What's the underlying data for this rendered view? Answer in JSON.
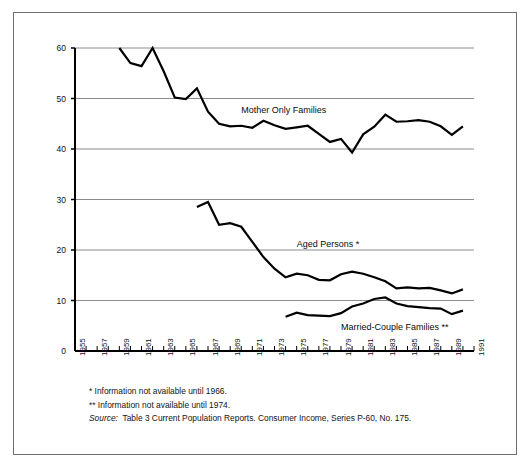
{
  "chart_data": {
    "type": "line",
    "title": "",
    "subtitle": "",
    "xlabel": "",
    "ylabel": "",
    "xlim": [
      1955,
      1991
    ],
    "ylim": [
      0,
      60
    ],
    "grid": "horizontal",
    "legend_position": "inline-annotations",
    "y_ticks": [
      0,
      10,
      20,
      30,
      40,
      50,
      60
    ],
    "y_tick_labels": [
      "0",
      "10",
      "20",
      "30",
      "40",
      "50",
      "60"
    ],
    "x_ticks": [
      1955,
      1956,
      1957,
      1958,
      1959,
      1960,
      1961,
      1962,
      1963,
      1964,
      1965,
      1966,
      1967,
      1968,
      1969,
      1970,
      1971,
      1972,
      1973,
      1974,
      1975,
      1976,
      1977,
      1978,
      1979,
      1980,
      1981,
      1982,
      1983,
      1984,
      1985,
      1986,
      1987,
      1988,
      1989,
      1990,
      1991
    ],
    "x_tick_labels": [
      "1955",
      "1957",
      "1959",
      "1961",
      "1963",
      "1965",
      "1967",
      "1969",
      "1971",
      "1973",
      "1975",
      "1977",
      "1979",
      "1981",
      "1983",
      "1985",
      "1987",
      "1989",
      "1991"
    ],
    "x_tick_labeled_years": [
      1955,
      1957,
      1959,
      1961,
      1963,
      1965,
      1967,
      1969,
      1971,
      1973,
      1975,
      1977,
      1979,
      1981,
      1983,
      1985,
      1987,
      1989,
      1991
    ],
    "series": [
      {
        "name": "Mother Only Families",
        "annotation": "Mother Only Families",
        "color": "#000000",
        "x": [
          1959,
          1960,
          1961,
          1962,
          1963,
          1964,
          1965,
          1966,
          1967,
          1968,
          1969,
          1970,
          1971,
          1972,
          1973,
          1974,
          1975,
          1976,
          1977,
          1978,
          1979,
          1980,
          1981,
          1982,
          1983,
          1984,
          1985,
          1986,
          1987,
          1988,
          1989,
          1990
        ],
        "values": [
          60.0,
          57.0,
          56.4,
          60.0,
          55.4,
          50.2,
          49.9,
          52.0,
          47.4,
          45.0,
          44.5,
          44.6,
          44.2,
          45.6,
          44.7,
          44.0,
          44.3,
          44.6,
          43.0,
          41.4,
          42.0,
          39.3,
          42.9,
          44.4,
          46.8,
          45.4,
          45.5,
          45.7,
          45.4,
          44.5,
          42.8,
          44.5
        ],
        "note": "Percent below poverty level, female householder, no husband present"
      },
      {
        "name": "Aged Persons *",
        "annotation": "Aged Persons *",
        "color": "#000000",
        "x": [
          1966,
          1967,
          1968,
          1969,
          1970,
          1971,
          1972,
          1973,
          1974,
          1975,
          1976,
          1977,
          1978,
          1979,
          1980,
          1981,
          1982,
          1983,
          1984,
          1985,
          1986,
          1987,
          1988,
          1989,
          1990
        ],
        "values": [
          28.5,
          29.5,
          25.0,
          25.3,
          24.6,
          21.6,
          18.6,
          16.3,
          14.6,
          15.3,
          15.0,
          14.1,
          14.0,
          15.2,
          15.7,
          15.3,
          14.6,
          13.8,
          12.4,
          12.6,
          12.4,
          12.5,
          12.0,
          11.4,
          12.2
        ],
        "note": "Persons 65 years and over below poverty level"
      },
      {
        "name": "Married-Couple Families **",
        "annotation": "Married-Couple Families **",
        "color": "#000000",
        "x": [
          1974,
          1975,
          1976,
          1977,
          1978,
          1979,
          1980,
          1981,
          1982,
          1983,
          1984,
          1985,
          1986,
          1987,
          1988,
          1989,
          1990
        ],
        "values": [
          6.8,
          7.6,
          7.1,
          7.0,
          6.9,
          7.5,
          8.8,
          9.4,
          10.3,
          10.6,
          9.4,
          8.9,
          8.7,
          8.5,
          8.4,
          7.3,
          8.0
        ],
        "note": "Married-couple families below poverty level"
      }
    ],
    "annotations": [
      {
        "text": "Mother Only Families",
        "x_year": 1970,
        "y_value": 47.5
      },
      {
        "text": "Aged Persons *",
        "x_year": 1975,
        "y_value": 21.0
      },
      {
        "text": "Married-Couple Families **",
        "x_year": 1979,
        "y_value": 4.5
      }
    ]
  },
  "notes": {
    "footnote_one": "*  Information not available until 1966.",
    "footnote_two": "** Information not available until 1974.",
    "source_label": "Source:",
    "source_text": "Table 3 Current Population Reports. Consumer Income, Series P-60, No. 175."
  }
}
